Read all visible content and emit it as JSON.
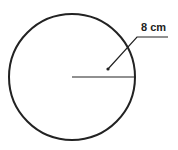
{
  "diagram": {
    "shape": "circle",
    "radius_label": "8 cm",
    "radius_value": 8,
    "unit": "cm",
    "stroke_color": "#222222",
    "background": "#ffffff"
  }
}
